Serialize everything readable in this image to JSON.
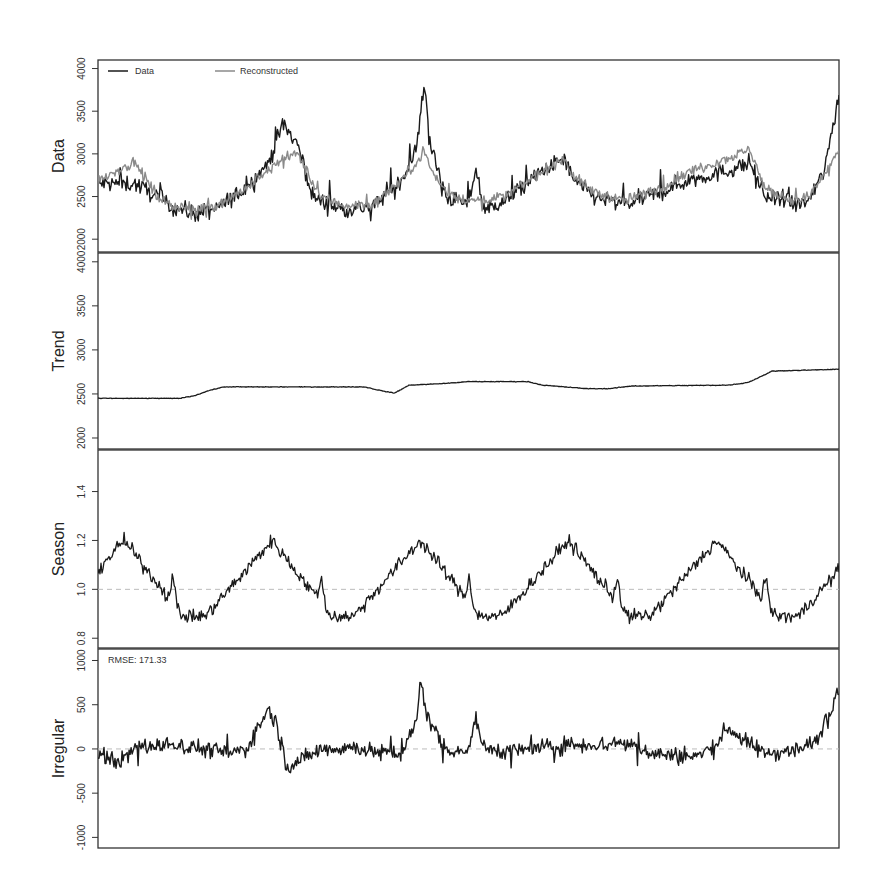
{
  "chart_data": {
    "type": "line",
    "title": "",
    "x_range": [
      0,
      1
    ],
    "n_points": 740,
    "panels": [
      {
        "name": "data",
        "ylabel": "Data",
        "ylim": [
          1850,
          4100
        ],
        "yticks": [
          2000,
          2500,
          3000,
          3500,
          4000
        ],
        "ytick_labels": [
          "2000",
          "2500",
          "3000",
          "3500",
          "4000"
        ],
        "legend": [
          {
            "label": "Data",
            "color": "#1a1a1a"
          },
          {
            "label": "Reconstructed",
            "color": "#8a8a8a"
          }
        ],
        "series": [
          {
            "name": "Data",
            "color": "#1a1a1a",
            "noise": 90,
            "anchors_x": [
              0,
              0.05,
              0.08,
              0.1,
              0.13,
              0.16,
              0.2,
              0.23,
              0.25,
              0.27,
              0.29,
              0.3,
              0.33,
              0.37,
              0.41,
              0.43,
              0.44,
              0.45,
              0.47,
              0.5,
              0.51,
              0.52,
              0.55,
              0.6,
              0.63,
              0.64,
              0.67,
              0.71,
              0.76,
              0.8,
              0.85,
              0.88,
              0.9,
              0.92,
              0.94,
              0.96,
              0.98,
              1.0
            ],
            "anchors_y": [
              2650,
              2650,
              2500,
              2380,
              2300,
              2350,
              2600,
              2900,
              3350,
              3100,
              2500,
              2450,
              2350,
              2380,
              2700,
              3050,
              3850,
              3050,
              2500,
              2400,
              2850,
              2350,
              2450,
              2800,
              2950,
              2700,
              2500,
              2400,
              2550,
              2700,
              2800,
              2900,
              2500,
              2450,
              2400,
              2450,
              2800,
              3700
            ]
          },
          {
            "name": "Reconstructed",
            "color": "#8a8a8a",
            "noise": 55,
            "anchors_x": [
              0,
              0.05,
              0.08,
              0.1,
              0.13,
              0.16,
              0.2,
              0.23,
              0.25,
              0.27,
              0.29,
              0.3,
              0.33,
              0.37,
              0.41,
              0.43,
              0.44,
              0.45,
              0.47,
              0.5,
              0.55,
              0.6,
              0.63,
              0.64,
              0.67,
              0.71,
              0.76,
              0.8,
              0.85,
              0.88,
              0.9,
              0.92,
              0.94,
              0.96,
              0.98,
              1.0
            ],
            "anchors_y": [
              2700,
              2900,
              2500,
              2400,
              2350,
              2400,
              2600,
              2800,
              2950,
              3000,
              2650,
              2500,
              2400,
              2400,
              2700,
              2900,
              3050,
              2800,
              2550,
              2450,
              2500,
              2800,
              2950,
              2750,
              2550,
              2450,
              2600,
              2800,
              2950,
              3050,
              2600,
              2500,
              2450,
              2500,
              2750,
              3050
            ]
          }
        ]
      },
      {
        "name": "trend",
        "ylabel": "Trend",
        "ylim": [
          1875,
          4100
        ],
        "yticks": [
          2000,
          2500,
          3000,
          3500,
          4000
        ],
        "ytick_labels": [
          "2000",
          "2500",
          "3000",
          "3500",
          "4000"
        ],
        "series": [
          {
            "name": "Trend",
            "color": "#1a1a1a",
            "noise": 3,
            "anchors_x": [
              0,
              0.11,
              0.13,
              0.15,
              0.17,
              0.2,
              0.36,
              0.38,
              0.4,
              0.42,
              0.47,
              0.5,
              0.58,
              0.6,
              0.66,
              0.69,
              0.72,
              0.85,
              0.87,
              0.88,
              0.91,
              1.0
            ],
            "anchors_y": [
              2450,
              2450,
              2480,
              2540,
              2580,
              2580,
              2580,
              2540,
              2510,
              2600,
              2620,
              2640,
              2640,
              2600,
              2560,
              2560,
              2590,
              2600,
              2620,
              2640,
              2760,
              2780
            ]
          }
        ]
      },
      {
        "name": "season",
        "ylabel": "Season",
        "ylim": [
          0.76,
          1.57
        ],
        "yticks": [
          0.8,
          1.0,
          1.2,
          1.4
        ],
        "ytick_labels": [
          "0.8",
          "1.0",
          "1.2",
          "1.4"
        ],
        "reference_line": 1.0,
        "series": [
          {
            "name": "Season",
            "color": "#1a1a1a",
            "noise": 0.025,
            "period": 0.2,
            "peak_offset": 0.035,
            "peak": 1.2,
            "trough": 0.89,
            "mini_peak": 1.0
          }
        ]
      },
      {
        "name": "irregular",
        "ylabel": "Irregular",
        "ylim": [
          -1120,
          1130
        ],
        "yticks": [
          -1000,
          -500,
          0,
          500,
          1000
        ],
        "ytick_labels": [
          "-1000",
          "-500",
          "0",
          "500",
          "1000"
        ],
        "reference_line": 0,
        "annotation": "RMSE: 171.33",
        "series": [
          {
            "name": "Irregular",
            "color": "#1a1a1a",
            "noise": 85,
            "anchors_x": [
              0,
              0.03,
              0.05,
              0.1,
              0.13,
              0.18,
              0.2,
              0.22,
              0.23,
              0.24,
              0.255,
              0.27,
              0.3,
              0.35,
              0.38,
              0.41,
              0.43,
              0.435,
              0.445,
              0.47,
              0.5,
              0.51,
              0.52,
              0.56,
              0.64,
              0.69,
              0.7,
              0.72,
              0.75,
              0.8,
              0.83,
              0.85,
              0.87,
              0.9,
              0.95,
              0.97,
              1.0
            ],
            "anchors_y": [
              -50,
              -150,
              20,
              50,
              20,
              -50,
              0,
              300,
              450,
              300,
              -200,
              -150,
              0,
              20,
              -50,
              -50,
              300,
              780,
              350,
              0,
              -30,
              400,
              0,
              -20,
              50,
              50,
              80,
              50,
              -50,
              -100,
              0,
              250,
              100,
              -50,
              0,
              100,
              700
            ]
          }
        ]
      }
    ]
  }
}
